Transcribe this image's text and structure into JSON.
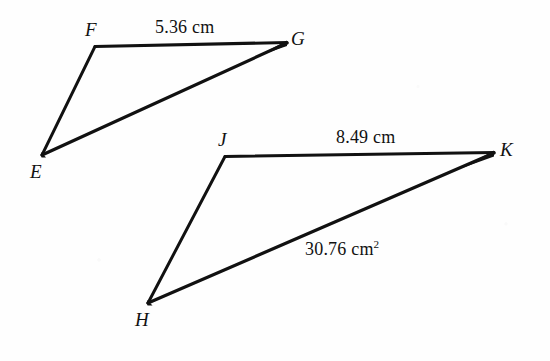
{
  "figure": {
    "background_color": "#fefefe",
    "stroke_color": "#111111",
    "width": 550,
    "height": 361,
    "shapes": [
      {
        "name": "triangle-efg",
        "vertices": [
          {
            "id": "E",
            "label": "E",
            "x": 42,
            "y": 155,
            "label_x": 30,
            "label_y": 162
          },
          {
            "id": "F",
            "label": "F",
            "x": 95,
            "y": 46,
            "label_x": 85,
            "label_y": 20
          },
          {
            "id": "G",
            "label": "G",
            "x": 287,
            "y": 42,
            "label_x": 291,
            "label_y": 29
          }
        ],
        "edges": [
          {
            "from": "F",
            "to": "G",
            "label": "5.36 cm",
            "label_unit": "cm",
            "label_value": "5.36",
            "label_x": 155,
            "label_y": 18
          },
          {
            "from": "G",
            "to": "E",
            "label": "",
            "label_value": "",
            "label_unit": ""
          },
          {
            "from": "E",
            "to": "F",
            "label": "",
            "label_value": "",
            "label_unit": ""
          }
        ]
      },
      {
        "name": "triangle-hjk",
        "vertices": [
          {
            "id": "H",
            "label": "H",
            "x": 148,
            "y": 303,
            "label_x": 135,
            "label_y": 310
          },
          {
            "id": "J",
            "label": "J",
            "x": 225,
            "y": 156,
            "label_x": 218,
            "label_y": 130
          },
          {
            "id": "K",
            "label": "K",
            "x": 494,
            "y": 152,
            "label_x": 500,
            "label_y": 140
          }
        ],
        "edges": [
          {
            "from": "J",
            "to": "K",
            "label": "8.49 cm",
            "label_unit": "cm",
            "label_value": "8.49",
            "label_x": 336,
            "label_y": 128
          },
          {
            "from": "K",
            "to": "H",
            "label": "30.76 cm2",
            "label_unit": "cm2",
            "label_value": "30.76",
            "label_x": 305,
            "label_y": 240
          },
          {
            "from": "H",
            "to": "J",
            "label": "",
            "label_value": "",
            "label_unit": ""
          }
        ]
      }
    ]
  },
  "labels": {
    "vertex_e": "E",
    "vertex_f": "F",
    "vertex_g": "G",
    "vertex_h": "H",
    "vertex_j": "J",
    "vertex_k": "K",
    "measure_fg": "5.36 cm",
    "measure_jk": "8.49 cm",
    "measure_hk_value": "30.76 cm",
    "measure_hk_exponent": "2"
  }
}
